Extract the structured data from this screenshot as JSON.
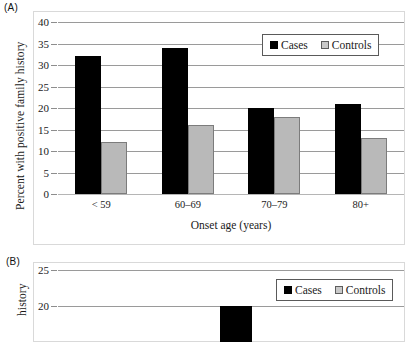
{
  "figure": {
    "panels": [
      {
        "label": "(A)"
      },
      {
        "label": "(B)"
      }
    ]
  },
  "panel_a": {
    "label": "(A)",
    "ylabel": "Percent with positive family history",
    "xlabel": "Onset age (years)",
    "legend": {
      "cases": "Cases",
      "controls": "Controls"
    }
  },
  "panel_b": {
    "label": "(B)",
    "ylabel": "history",
    "legend": {
      "cases": "Cases",
      "controls": "Controls"
    }
  },
  "colors": {
    "cases": "#000000",
    "controls": "#b9b9b9",
    "controls_border": "#7c7c7c",
    "gridline": "#9a9a9a",
    "frame": "#d9d9d9",
    "text": "#1a1a1a"
  },
  "chart_data": [
    {
      "type": "bar",
      "panel": "(A)",
      "title": "",
      "xlabel": "Onset age (years)",
      "ylabel": "Percent with positive family history",
      "categories": [
        "< 59",
        "60–69",
        "70–79",
        "80+"
      ],
      "series": [
        {
          "name": "Cases",
          "values": [
            32,
            34,
            20,
            21
          ],
          "color": "#000000"
        },
        {
          "name": "Controls",
          "values": [
            12,
            16,
            18,
            13
          ],
          "color": "#b9b9b9"
        }
      ],
      "ylim": [
        0,
        40
      ],
      "yticks": [
        0,
        5,
        10,
        15,
        20,
        25,
        30,
        35,
        40
      ],
      "ytick_labels": [
        "0",
        "5",
        "10",
        "15",
        "20",
        "25",
        "30",
        "35",
        "40"
      ],
      "grid": true,
      "legend_position": "top-right"
    },
    {
      "type": "bar",
      "panel": "(B)",
      "note": "cropped at image bottom edge",
      "title": "",
      "xlabel": "",
      "ylabel": "history",
      "categories": [],
      "series": [
        {
          "name": "Cases",
          "values": [
            20
          ],
          "color": "#000000"
        },
        {
          "name": "Controls",
          "values": [],
          "color": "#b9b9b9"
        }
      ],
      "ylim": [
        0,
        25
      ],
      "yticks": [
        20,
        25
      ],
      "ytick_labels": [
        "20",
        "25"
      ],
      "grid": true,
      "legend_position": "top-right"
    }
  ]
}
